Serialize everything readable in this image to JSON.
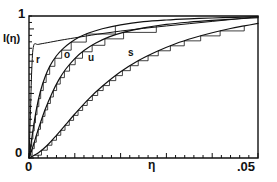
{
  "figure": {
    "name": "cumulative-intensity-plot",
    "background": "#ffffff",
    "ink": "#111111"
  },
  "axes": {
    "y_label": "I(η)",
    "y_top_tick": "1",
    "y_zero_tick": "0",
    "x_label": "η",
    "x_zero_tick": "0",
    "x_max_tick": ".05"
  },
  "curve_labels": {
    "r": "r",
    "o": "o",
    "u": "u",
    "s": "s"
  },
  "chart_data": {
    "type": "line",
    "title": "",
    "xlabel": "η",
    "ylabel": "I(η)",
    "xlim": [
      0,
      0.05
    ],
    "ylim": [
      0,
      1
    ],
    "xticks": [
      0,
      0.05
    ],
    "xticklabels": [
      "0",
      ".05"
    ],
    "yticks": [
      0,
      1
    ],
    "yticklabels": [
      "0",
      "1"
    ],
    "grid": false,
    "legend": "inline-curve-labels",
    "annotations": [
      {
        "text": "r",
        "x": 0.0015,
        "y": 0.69
      },
      {
        "text": "o",
        "x": 0.0075,
        "y": 0.73
      },
      {
        "text": "u",
        "x": 0.0128,
        "y": 0.7
      },
      {
        "text": "s",
        "x": 0.021,
        "y": 0.74
      }
    ],
    "series": [
      {
        "name": "r",
        "style": "smooth",
        "x": [
          0.0,
          0.0003,
          0.0006,
          0.001,
          0.002,
          0.004,
          0.007,
          0.01,
          0.015,
          0.02,
          0.025,
          0.03,
          0.035,
          0.04,
          0.045,
          0.05
        ],
        "y": [
          0.0,
          0.3,
          0.62,
          0.79,
          0.8,
          0.812,
          0.83,
          0.846,
          0.872,
          0.894,
          0.913,
          0.93,
          0.946,
          0.962,
          0.978,
          0.995
        ]
      },
      {
        "name": "o",
        "style": "smooth-with-staircase",
        "x": [
          0.0,
          0.0008,
          0.0016,
          0.0025,
          0.0035,
          0.0045,
          0.006,
          0.0075,
          0.009,
          0.011,
          0.013,
          0.016,
          0.02,
          0.025,
          0.03,
          0.035,
          0.04,
          0.045,
          0.05
        ],
        "y": [
          0.0,
          0.18,
          0.34,
          0.47,
          0.57,
          0.645,
          0.72,
          0.772,
          0.812,
          0.852,
          0.88,
          0.91,
          0.938,
          0.96,
          0.972,
          0.98,
          0.986,
          0.991,
          0.995
        ]
      },
      {
        "name": "u",
        "style": "smooth-with-staircase",
        "x": [
          0.0,
          0.001,
          0.002,
          0.0035,
          0.005,
          0.0065,
          0.008,
          0.01,
          0.012,
          0.0145,
          0.0175,
          0.021,
          0.025,
          0.03,
          0.035,
          0.04,
          0.045,
          0.05
        ],
        "y": [
          0.0,
          0.095,
          0.2,
          0.34,
          0.455,
          0.55,
          0.625,
          0.7,
          0.757,
          0.808,
          0.853,
          0.888,
          0.916,
          0.941,
          0.957,
          0.969,
          0.979,
          0.988
        ]
      },
      {
        "name": "s",
        "style": "smooth-with-staircase",
        "x": [
          0.0,
          0.002,
          0.004,
          0.006,
          0.008,
          0.01,
          0.013,
          0.016,
          0.02,
          0.024,
          0.028,
          0.032,
          0.036,
          0.04,
          0.044,
          0.047,
          0.05
        ],
        "y": [
          0.0,
          0.035,
          0.09,
          0.16,
          0.235,
          0.31,
          0.415,
          0.505,
          0.607,
          0.688,
          0.752,
          0.805,
          0.847,
          0.882,
          0.912,
          0.93,
          0.948
        ]
      }
    ]
  }
}
